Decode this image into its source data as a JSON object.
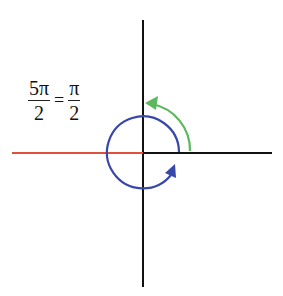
{
  "equation": {
    "left": {
      "numerator": "5π",
      "denominator": "2"
    },
    "operator": "=",
    "right": {
      "numerator": "π",
      "denominator": "2"
    }
  },
  "diagram": {
    "colors": {
      "axes": "#111111",
      "negative_x_ray": "#e0503a",
      "full_rotation_circle": "#3848a8",
      "quarter_turn_arc": "#5cb85c"
    }
  }
}
